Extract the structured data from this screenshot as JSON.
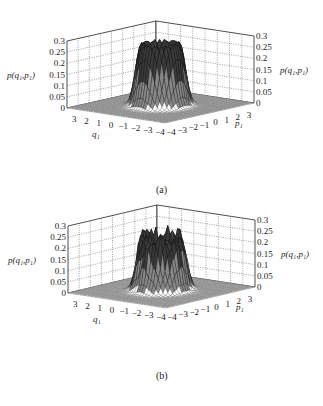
{
  "figure": {
    "panels": [
      {
        "id": "a",
        "caption": "(a)"
      },
      {
        "id": "b",
        "caption": "(b)"
      }
    ]
  },
  "axes": {
    "z_label": "p(q₁,p₁)",
    "q_label": "q₁",
    "p_label": "p₁",
    "z_ticks": [
      "0",
      "0.05",
      "0.1",
      "0.15",
      "0.2",
      "0.25",
      "0.3"
    ],
    "q_ticks": [
      "3",
      "2",
      "1",
      "0",
      "−1",
      "−2",
      "−3",
      "−4"
    ],
    "p_ticks": [
      "−4",
      "−3",
      "−2",
      "−1",
      "0",
      "1",
      "2",
      "3"
    ]
  },
  "chart_data": [
    {
      "type": "surface3d",
      "title": "(a)",
      "xlabel": "q1",
      "ylabel": "p1",
      "zlabel": "p(q1,p1)",
      "x_range": [
        -4,
        4
      ],
      "y_range": [
        -4,
        4
      ],
      "zlim": [
        0,
        0.3
      ],
      "z_ticks": [
        0,
        0.05,
        0.1,
        0.15,
        0.2,
        0.25,
        0.3
      ],
      "x_ticks": [
        3,
        2,
        1,
        0,
        -1,
        -2,
        -3,
        -4
      ],
      "y_ticks": [
        -4,
        -3,
        -2,
        -1,
        0,
        1,
        2,
        3
      ],
      "grid": true,
      "description": "Ring/crater-shaped distribution centered at origin, flat-topped rim near z≈0.28, dip in center, zero elsewhere",
      "peak_z": 0.28,
      "ring_radius_approx": 1.2
    },
    {
      "type": "surface3d",
      "title": "(b)",
      "xlabel": "q1",
      "ylabel": "p1",
      "zlabel": "p(q1,p1)",
      "x_range": [
        -4,
        4
      ],
      "y_range": [
        -4,
        4
      ],
      "zlim": [
        0,
        0.3
      ],
      "z_ticks": [
        0,
        0.05,
        0.1,
        0.15,
        0.2,
        0.25,
        0.3
      ],
      "x_ticks": [
        3,
        2,
        1,
        0,
        -1,
        -2,
        -3,
        -4
      ],
      "y_ticks": [
        -4,
        -3,
        -2,
        -1,
        0,
        1,
        2,
        3
      ],
      "grid": true,
      "description": "Similar ring/crater distribution centered at origin with irregular, jagged peaked rim reaching z≈0.27",
      "peak_z": 0.27,
      "ring_radius_approx": 1.2
    }
  ]
}
